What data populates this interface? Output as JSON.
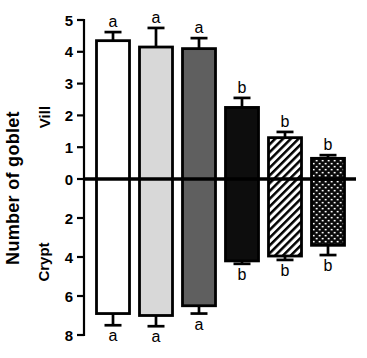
{
  "chart_data": {
    "type": "bar",
    "subtype": "diverging-vertical-with-error-bars",
    "title": "",
    "ylabel": "Number of goblet",
    "sections": {
      "upper": "Vill",
      "lower": "Crypt"
    },
    "upper_axis": {
      "label": "Vill",
      "ticks": [
        5,
        4,
        3,
        2,
        1,
        0
      ],
      "max": 5
    },
    "lower_axis": {
      "label": "Crypt",
      "ticks": [
        2,
        4,
        6,
        8
      ],
      "max": 8
    },
    "legend": "none",
    "grid": "off",
    "bars": [
      {
        "style": "white",
        "fill": "#ffffff",
        "vill": {
          "value": 4.35,
          "error": 0.27,
          "letter": "a"
        },
        "crypt": {
          "value": 6.9,
          "error": 0.6,
          "letter": "a"
        }
      },
      {
        "style": "light-gray",
        "fill": "#d8d8d8",
        "vill": {
          "value": 4.15,
          "error": 0.6,
          "letter": "a"
        },
        "crypt": {
          "value": 7.0,
          "error": 0.55,
          "letter": "a"
        }
      },
      {
        "style": "dark-gray",
        "fill": "#5f5f5f",
        "vill": {
          "value": 4.1,
          "error": 0.33,
          "letter": "a"
        },
        "crypt": {
          "value": 6.5,
          "error": 0.4,
          "letter": "a"
        }
      },
      {
        "style": "black",
        "fill": "#0d0d0d",
        "vill": {
          "value": 2.25,
          "error": 0.3,
          "letter": "b"
        },
        "crypt": {
          "value": 4.2,
          "error": 0.15,
          "letter": "b"
        }
      },
      {
        "style": "diagonal-hatch",
        "pattern": "hatch-pattern",
        "fill": "#ffffff",
        "vill": {
          "value": 1.3,
          "error": 0.18,
          "letter": "b"
        },
        "crypt": {
          "value": 3.95,
          "error": 0.2,
          "letter": "b"
        }
      },
      {
        "style": "stipple-dots",
        "pattern": "dot-pattern",
        "fill": "#0d0d0d",
        "vill": {
          "value": 0.65,
          "error": 0.1,
          "letter": "b"
        },
        "crypt": {
          "value": 3.4,
          "error": 0.5,
          "letter": "b"
        }
      }
    ],
    "colors": {
      "axis": "#000000",
      "bar_outline": "#000000",
      "letters": "#000000"
    }
  }
}
